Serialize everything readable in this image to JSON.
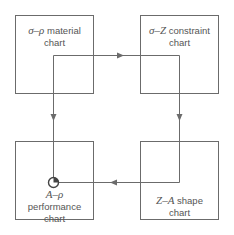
{
  "diagram": {
    "boxes": [
      {
        "id": "material",
        "symbol": "σ–ρ",
        "line1": "material",
        "line2": "chart"
      },
      {
        "id": "constraint",
        "symbol": "σ–Z",
        "line1": "constraint",
        "line2": "chart"
      },
      {
        "id": "performance",
        "symbol": "A–ρ",
        "line1": "performance",
        "line2": "chart"
      },
      {
        "id": "shape",
        "symbol": "Z–A",
        "line1": "shape",
        "line2": "chart"
      }
    ],
    "flow": [
      "material",
      "constraint",
      "shape",
      "performance"
    ],
    "colors": {
      "stroke": "#6b6b6b",
      "text": "#555555",
      "background": "#ffffff"
    }
  }
}
